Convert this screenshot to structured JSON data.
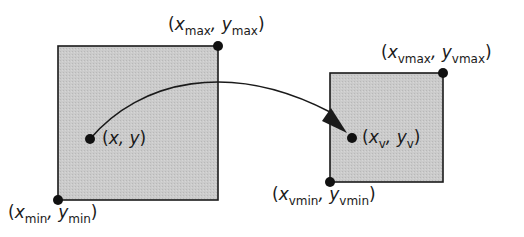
{
  "diagram": {
    "colors": {
      "box_fill": "#c9c9c9",
      "stroke": "#1a1a1a",
      "background": "#ffffff"
    },
    "window": {
      "rect": {
        "x": 58,
        "y": 46,
        "w": 160,
        "h": 154
      },
      "corner_max": {
        "x": 218,
        "y": 46
      },
      "corner_min": {
        "x": 58,
        "y": 200
      },
      "point": {
        "x": 90,
        "y": 139
      },
      "labels": {
        "max": {
          "open": "(",
          "x": "x",
          "x_sub": "max",
          "sep": ", ",
          "y": "y",
          "y_sub": "max",
          "close": ")"
        },
        "min": {
          "open": "(",
          "x": "x",
          "x_sub": "min",
          "sep": ", ",
          "y": "y",
          "y_sub": "min",
          "close": ")"
        },
        "point": {
          "open": "(",
          "x": "x",
          "sep": ", ",
          "y": "y",
          "close": ")"
        }
      }
    },
    "viewport": {
      "rect": {
        "x": 330,
        "y": 73,
        "w": 113,
        "h": 109
      },
      "corner_max": {
        "x": 443,
        "y": 73
      },
      "corner_min": {
        "x": 330,
        "y": 182
      },
      "point": {
        "x": 352,
        "y": 138
      },
      "labels": {
        "max": {
          "open": "(",
          "x": "x",
          "x_sub": "vmax",
          "sep": ", ",
          "y": "y",
          "y_sub": "vmax",
          "close": ")"
        },
        "min": {
          "open": "(",
          "x": "x",
          "x_sub": "vmin",
          "sep": ", ",
          "y": "y",
          "y_sub": "vmin",
          "close": ")"
        },
        "point": {
          "open": "(",
          "x": "x",
          "x_sub": "v",
          "sep": ", ",
          "y": "y",
          "y_sub": "v",
          "close": ")"
        }
      }
    },
    "arrow": {
      "from": {
        "x": 90,
        "y": 139
      },
      "to": {
        "x": 347,
        "y": 134
      },
      "control": {
        "x": 218,
        "y": 20
      }
    }
  }
}
